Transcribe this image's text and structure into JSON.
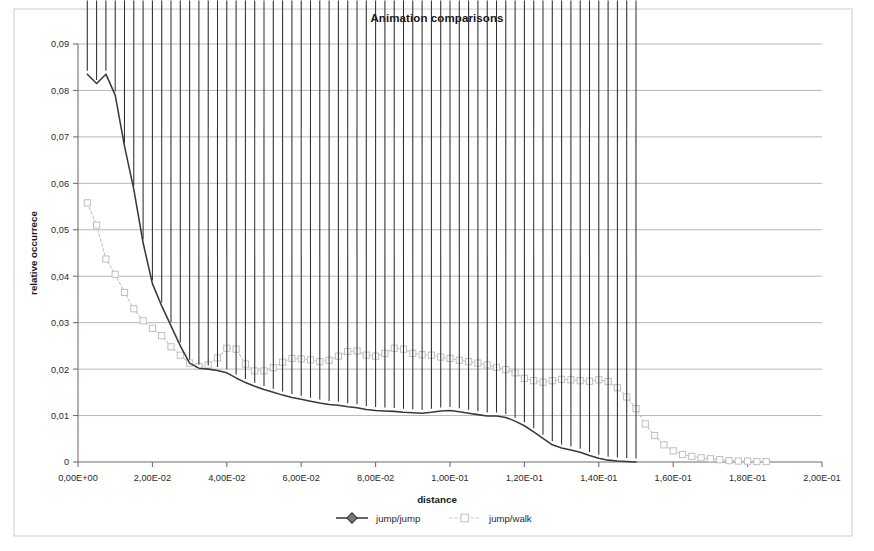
{
  "chart_data": {
    "type": "line",
    "title": "Animation comparisons",
    "xlabel": "distance",
    "ylabel": "relative occurrece",
    "xlim": [
      0,
      0.2
    ],
    "ylim": [
      0,
      0.09
    ],
    "grid": "horizontal",
    "legend_position": "bottom",
    "x_tick_labels": [
      "0,00E+00",
      "2,00E-02",
      "4,00E-02",
      "6,00E-02",
      "8,00E-02",
      "1,00E-01",
      "1,20E-01",
      "1,40E-01",
      "1,60E-01",
      "1,80E-01",
      "2,00E-01"
    ],
    "x_tick_values": [
      0,
      0.02,
      0.04,
      0.06,
      0.08,
      0.1,
      0.12,
      0.14,
      0.16,
      0.18,
      0.2
    ],
    "y_tick_labels": [
      "0",
      "0,01",
      "0,02",
      "0,03",
      "0,04",
      "0,05",
      "0,06",
      "0,07",
      "0,08",
      "0,09"
    ],
    "y_tick_values": [
      0,
      0.01,
      0.02,
      0.03,
      0.04,
      0.05,
      0.06,
      0.07,
      0.08,
      0.09
    ],
    "series": [
      {
        "name": "jump/jump",
        "color": "#3a3a3a",
        "marker": "diamond-filled",
        "x": [
          0.0025,
          0.005,
          0.0075,
          0.01,
          0.0125,
          0.015,
          0.0175,
          0.02,
          0.0225,
          0.025,
          0.0275,
          0.03,
          0.0325,
          0.035,
          0.0375,
          0.04,
          0.0425,
          0.045,
          0.0475,
          0.05,
          0.0525,
          0.055,
          0.0575,
          0.06,
          0.0625,
          0.065,
          0.0675,
          0.07,
          0.0725,
          0.075,
          0.0775,
          0.08,
          0.0825,
          0.085,
          0.0875,
          0.09,
          0.0925,
          0.095,
          0.0975,
          0.1,
          0.1025,
          0.105,
          0.1075,
          0.11,
          0.1125,
          0.115,
          0.1175,
          0.12,
          0.1225,
          0.125,
          0.1275,
          0.13,
          0.1325,
          0.135,
          0.1375,
          0.14,
          0.1425,
          0.145,
          0.1475,
          0.15
        ],
        "y": [
          0.0835,
          0.0815,
          0.0835,
          0.079,
          0.068,
          0.0587,
          0.0472,
          0.0384,
          0.0336,
          0.0293,
          0.025,
          0.0213,
          0.0202,
          0.02,
          0.0197,
          0.0192,
          0.0181,
          0.0171,
          0.0163,
          0.0156,
          0.015,
          0.0144,
          0.0139,
          0.0135,
          0.0131,
          0.0127,
          0.0124,
          0.0122,
          0.0119,
          0.0117,
          0.0113,
          0.0111,
          0.011,
          0.0109,
          0.0107,
          0.0106,
          0.0105,
          0.0107,
          0.011,
          0.0111,
          0.0108,
          0.0105,
          0.0102,
          0.0099,
          0.0099,
          0.0096,
          0.0088,
          0.0078,
          0.0065,
          0.0051,
          0.0037,
          0.003,
          0.0026,
          0.0021,
          0.0014,
          0.0008,
          0.0004,
          0.0002,
          0.0001,
          0.0
        ]
      },
      {
        "name": "jump/walk",
        "color": "#c2c2c2",
        "marker": "square-open",
        "x": [
          0.0025,
          0.005,
          0.0075,
          0.01,
          0.0125,
          0.015,
          0.0175,
          0.02,
          0.0225,
          0.025,
          0.0275,
          0.03,
          0.0325,
          0.035,
          0.0375,
          0.04,
          0.0425,
          0.045,
          0.0475,
          0.05,
          0.0525,
          0.055,
          0.0575,
          0.06,
          0.0625,
          0.065,
          0.0675,
          0.07,
          0.0725,
          0.075,
          0.0775,
          0.08,
          0.0825,
          0.085,
          0.0875,
          0.09,
          0.0925,
          0.095,
          0.0975,
          0.1,
          0.1025,
          0.105,
          0.1075,
          0.11,
          0.1125,
          0.115,
          0.1175,
          0.12,
          0.1225,
          0.125,
          0.1275,
          0.13,
          0.1325,
          0.135,
          0.1375,
          0.14,
          0.1425,
          0.145,
          0.1475,
          0.15,
          0.1525,
          0.155,
          0.1575,
          0.16,
          0.1625,
          0.165,
          0.1675,
          0.17,
          0.1725,
          0.175,
          0.1775,
          0.18,
          0.1825,
          0.185
        ],
        "y": [
          0.0558,
          0.051,
          0.0437,
          0.0404,
          0.0365,
          0.033,
          0.0304,
          0.0288,
          0.0272,
          0.0248,
          0.023,
          0.0213,
          0.0206,
          0.0209,
          0.0224,
          0.0245,
          0.0243,
          0.0211,
          0.0196,
          0.0196,
          0.0203,
          0.0215,
          0.0223,
          0.0222,
          0.022,
          0.0216,
          0.0219,
          0.0228,
          0.0238,
          0.0239,
          0.023,
          0.0228,
          0.0234,
          0.0245,
          0.0243,
          0.0234,
          0.0231,
          0.023,
          0.0226,
          0.0223,
          0.0219,
          0.0216,
          0.0213,
          0.0209,
          0.0204,
          0.0199,
          0.0192,
          0.018,
          0.0175,
          0.0172,
          0.0175,
          0.0178,
          0.0177,
          0.0175,
          0.0174,
          0.0177,
          0.0173,
          0.016,
          0.014,
          0.0115,
          0.0082,
          0.0057,
          0.0037,
          0.0024,
          0.0016,
          0.0012,
          0.0009,
          0.0007,
          0.0005,
          0.0003,
          0.0002,
          0.0002,
          0.0001,
          0.0001
        ]
      }
    ]
  },
  "legend": {
    "items": [
      {
        "label": "jump/jump"
      },
      {
        "label": "jump/walk"
      }
    ]
  }
}
